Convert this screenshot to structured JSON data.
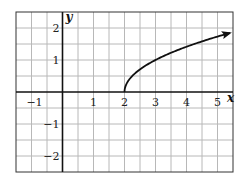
{
  "chart_data": {
    "type": "line",
    "title": "",
    "xlabel": "x",
    "ylabel": "y",
    "xlim": [
      -1.5,
      5.5
    ],
    "ylim": [
      -2.5,
      2.5
    ],
    "grid": true,
    "grid_step": 0.5,
    "x_ticks": [
      {
        "value": -1,
        "label": "−1"
      },
      {
        "value": 1,
        "label": "1"
      },
      {
        "value": 2,
        "label": "2"
      },
      {
        "value": 3,
        "label": "3"
      },
      {
        "value": 4,
        "label": "4"
      },
      {
        "value": 5,
        "label": "5"
      }
    ],
    "y_ticks": [
      {
        "value": 2,
        "label": "2"
      },
      {
        "value": 1,
        "label": "1"
      },
      {
        "value": -1,
        "label": "−1"
      },
      {
        "value": -2,
        "label": "−2"
      }
    ],
    "series": [
      {
        "name": "y = sqrt(x - 2)",
        "function": "sqrt(x-2)",
        "x_start": 2,
        "x_end": 5.4,
        "arrow_end": true,
        "points": [
          [
            2,
            0
          ],
          [
            2.25,
            0.5
          ],
          [
            3,
            1
          ],
          [
            4,
            1.41
          ],
          [
            5,
            1.73
          ],
          [
            5.4,
            1.84
          ]
        ]
      }
    ]
  }
}
